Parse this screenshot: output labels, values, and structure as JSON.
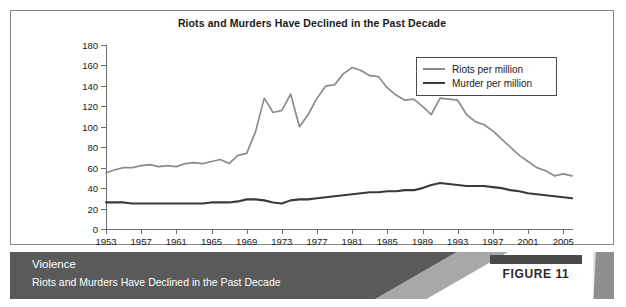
{
  "chart_data": {
    "type": "line",
    "title": "Riots and Murders Have Declined in the Past Decade",
    "xlabel": "",
    "ylabel": "",
    "ylim": [
      0,
      180
    ],
    "ytick_step": 20,
    "yticks": [
      "0",
      "20",
      "40",
      "60",
      "80",
      "100",
      "120",
      "140",
      "160",
      "180"
    ],
    "xlim": [
      1953,
      2006
    ],
    "xticks": [
      "1953",
      "1957",
      "1961",
      "1965",
      "1969",
      "1973",
      "1977",
      "1981",
      "1985",
      "1989",
      "1993",
      "1997",
      "2001",
      "2005"
    ],
    "grid": false,
    "legend_position": "top-right",
    "x": [
      1953,
      1954,
      1955,
      1956,
      1957,
      1958,
      1959,
      1960,
      1961,
      1962,
      1963,
      1964,
      1965,
      1966,
      1967,
      1968,
      1969,
      1970,
      1971,
      1972,
      1973,
      1974,
      1975,
      1976,
      1977,
      1978,
      1979,
      1980,
      1981,
      1982,
      1983,
      1984,
      1985,
      1986,
      1987,
      1988,
      1989,
      1990,
      1991,
      1992,
      1993,
      1994,
      1995,
      1996,
      1997,
      1998,
      1999,
      2000,
      2001,
      2002,
      2003,
      2004,
      2005,
      2006
    ],
    "series": [
      {
        "name": "Riots per million",
        "color": "#8c8c8c",
        "values": [
          55,
          58,
          60,
          60,
          62,
          63,
          61,
          62,
          61,
          64,
          65,
          64,
          66,
          68,
          64,
          72,
          74,
          95,
          128,
          114,
          116,
          132,
          100,
          112,
          128,
          140,
          141,
          152,
          158,
          155,
          150,
          149,
          138,
          131,
          126,
          127,
          120,
          112,
          128,
          127,
          126,
          112,
          105,
          102,
          96,
          88,
          80,
          72,
          66,
          60,
          57,
          52,
          54,
          52
        ]
      },
      {
        "name": "Murder per million",
        "color": "#3a3a3a",
        "values": [
          26,
          26,
          26,
          25,
          25,
          25,
          25,
          25,
          25,
          25,
          25,
          25,
          26,
          26,
          26,
          27,
          29,
          29,
          28,
          26,
          25,
          28,
          29,
          29,
          30,
          31,
          32,
          33,
          34,
          35,
          36,
          36,
          37,
          37,
          38,
          38,
          40,
          43,
          45,
          44,
          43,
          42,
          42,
          42,
          41,
          40,
          38,
          37,
          35,
          34,
          33,
          32,
          31,
          30
        ]
      }
    ]
  },
  "legend": {
    "entries": [
      {
        "label": "Riots per million"
      },
      {
        "label": "Murder per million"
      }
    ]
  },
  "footer": {
    "title": "Violence",
    "subtitle": "Riots and Murders Have Declined in the Past Decade",
    "figure_label": "FIGURE 11"
  }
}
